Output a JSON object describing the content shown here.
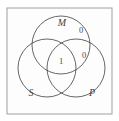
{
  "figure": {
    "type": "venn-diagram-3-set",
    "frame": {
      "x": 7,
      "y": 8,
      "width": 105,
      "height": 106,
      "stroke_color": "#a8a8a8",
      "fill_color": "#fdfdfd"
    },
    "circle_stroke_color": "#4a4a4a",
    "label_color": "#3d3d3d",
    "circles": [
      {
        "name": "top-circle-M",
        "cx": 61,
        "cy": 45,
        "r": 29
      },
      {
        "name": "left-circle-S",
        "cx": 47,
        "cy": 68,
        "r": 29
      },
      {
        "name": "right-circle-P",
        "cx": 76,
        "cy": 68,
        "r": 29
      }
    ],
    "set_labels": [
      {
        "name": "set-label-m",
        "text": "M",
        "x": 62,
        "y": 24
      },
      {
        "name": "set-label-s",
        "text": "S",
        "x": 31,
        "y": 94
      },
      {
        "name": "set-label-p",
        "text": "P",
        "x": 92,
        "y": 94
      }
    ],
    "region_labels": [
      {
        "name": "region-label-zero-upper",
        "text": "0",
        "x": 81,
        "y": 31
      },
      {
        "name": "region-label-zero-right",
        "text": "0",
        "x": 84,
        "y": 56
      },
      {
        "name": "region-label-one-center",
        "text": "1",
        "x": 61,
        "y": 62
      }
    ]
  }
}
